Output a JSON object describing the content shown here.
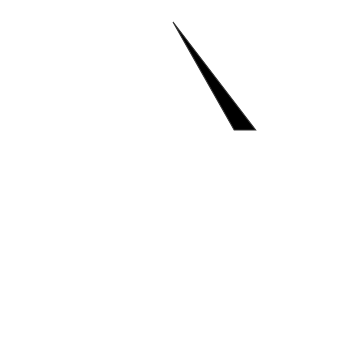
{
  "axes": {
    "clay": {
      "label": "% Clay",
      "ticks": [
        "0",
        "10",
        "20",
        "30",
        "40",
        "50",
        "60",
        "70",
        "80",
        "90",
        "100"
      ]
    },
    "silt": {
      "label": "% Silt",
      "ticks": [
        "0",
        "10",
        "20",
        "30",
        "40",
        "50",
        "60",
        "70",
        "80",
        "90",
        "100"
      ]
    },
    "sand": {
      "label": "% Sand",
      "ticks": [
        "100",
        "90",
        "80",
        "70",
        "60",
        "50",
        "40",
        "30",
        "20",
        "10",
        "0"
      ]
    }
  },
  "regions": {
    "clay": {
      "label": "Clay",
      "color": "#ececec"
    },
    "sandy_clay": {
      "label_1": "Sandy",
      "label_2": "clay",
      "color": "#e4e4e4"
    },
    "silty_clay": {
      "label_1": "Silty",
      "label_2": "clay",
      "color": "#cdcdcd"
    },
    "sandy_clay_loam": {
      "label_1": "Sandy",
      "label_2": "clay loam",
      "color": "#c8c8c8"
    },
    "clay_loam": {
      "label": "Clay loam",
      "color": "#b9b9b9"
    },
    "silty_clay_loam": {
      "label_1": "Silty",
      "label_2": "clay loam",
      "color": "#b9b9b9"
    },
    "loam": {
      "label": "Loam",
      "color": "#b4b4b4"
    },
    "sandy_loam": {
      "label": "Sandy loam",
      "color": "#b0b0b0"
    },
    "silty_loam": {
      "label": "Silty loam",
      "color": "#a8a8a8"
    },
    "loamy_sand": {
      "label_1": "Loamy",
      "label_2": "sand",
      "color": "#9a9a9a"
    },
    "sand": {
      "label": "Sand",
      "color": "#888888"
    },
    "silt": {
      "label": "Silt",
      "color": "#9a9a9a"
    }
  }
}
